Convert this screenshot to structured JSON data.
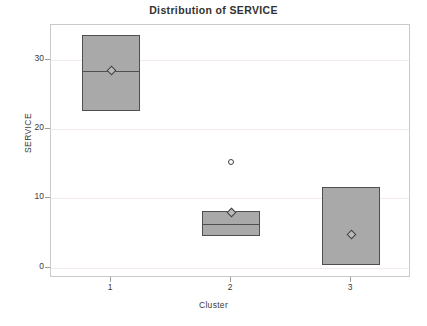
{
  "chart_data": {
    "type": "box",
    "title": "Distribution of SERVICE",
    "xlabel": "Cluster",
    "ylabel": "SERVICE",
    "categories": [
      "1",
      "2",
      "3"
    ],
    "ytick_labels": [
      "0",
      "10",
      "20",
      "30"
    ],
    "ytick_values": [
      0,
      10,
      20,
      30
    ],
    "ylim": [
      -1.5,
      35
    ],
    "xlim": [
      0.5,
      3.5
    ],
    "grid": "horizontal",
    "legend": "none",
    "boxes": [
      {
        "category": "1",
        "box_top": 33.5,
        "box_bottom": 22.5,
        "median": 28.4,
        "mean": 28.4,
        "whisker_high": null,
        "whisker_low": null,
        "outliers": []
      },
      {
        "category": "2",
        "box_top": 8.1,
        "box_bottom": 4.5,
        "median": 6.3,
        "mean": 8.0,
        "whisker_high": null,
        "whisker_low": null,
        "outliers": [
          15.2
        ]
      },
      {
        "category": "3",
        "box_top": 11.7,
        "box_bottom": 0.4,
        "median": null,
        "mean": 4.8,
        "whisker_high": null,
        "whisker_low": null,
        "outliers": []
      }
    ],
    "colors": {
      "box_fill": "#a9a9a9",
      "box_border": "#4f4f4f",
      "gridline": "#f3eaea",
      "frame": "#c9c9c9",
      "text": "#3a3a3a",
      "background": "#ffffff"
    }
  }
}
